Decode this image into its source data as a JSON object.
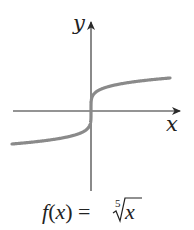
{
  "chart_data": {
    "type": "line",
    "title": "",
    "function": "f(x) = fifth root of x",
    "xlabel": "x",
    "ylabel": "y",
    "grid": false,
    "ticks": false,
    "caption": "f(x) = ∛x (fifth root)",
    "series": [
      {
        "name": "f(x) = x^(1/5)",
        "color": "#8a8a8a",
        "x": [
          -32,
          -16,
          -8,
          -4,
          -1,
          -0.1,
          -0.01,
          0,
          0.01,
          0.1,
          1,
          4,
          8,
          16,
          32
        ],
        "y": [
          -2,
          -1.741,
          -1.516,
          -1.32,
          -1,
          -0.631,
          -0.398,
          0,
          0.398,
          0.631,
          1,
          1.32,
          1.516,
          1.741,
          2
        ]
      }
    ],
    "xlim": [
      -32,
      32
    ],
    "ylim": [
      -5,
      5
    ]
  },
  "labels": {
    "y_axis": "y",
    "x_axis": "x",
    "formula_lhs": "f(x) = ",
    "root_index": "5",
    "radicand": "x"
  },
  "colors": {
    "axis": "#2a2a2a",
    "curve": "#8a8a8a",
    "text": "#222222"
  }
}
